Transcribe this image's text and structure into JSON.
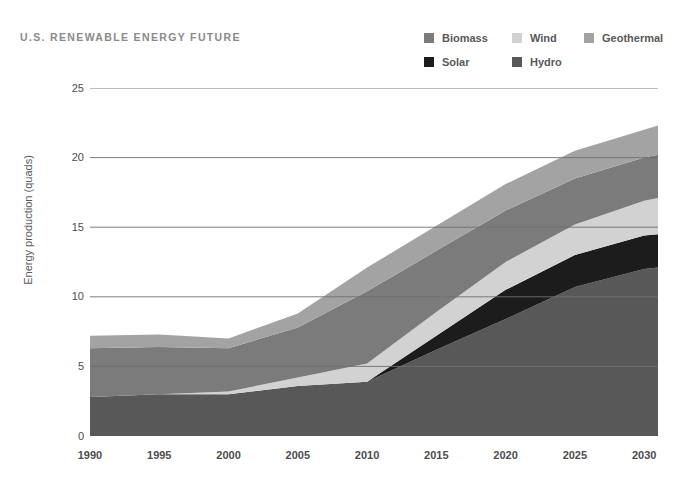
{
  "title": "U.S. RENEWABLE ENERGY FUTURE",
  "legend": {
    "rows": [
      [
        {
          "label": "Biomass",
          "color": "#7b7b7b",
          "x": 0
        },
        {
          "label": "Wind",
          "color": "#d2d2d2",
          "x": 88
        },
        {
          "label": "Geothermal",
          "color": "#a3a3a3",
          "x": 160
        }
      ],
      [
        {
          "label": "Solar",
          "color": "#1c1c1c",
          "x": 0
        },
        {
          "label": "Hydro",
          "color": "#585858",
          "x": 88
        }
      ]
    ]
  },
  "chart_data": {
    "type": "area",
    "stacked": true,
    "title": "U.S. RENEWABLE ENERGY FUTURE",
    "xlabel": "",
    "ylabel": "Energy production (quads)",
    "xlim": [
      1990,
      2031
    ],
    "ylim": [
      0,
      25
    ],
    "yticks": [
      0,
      5,
      10,
      15,
      20,
      25
    ],
    "xticks": [
      1990,
      1995,
      2000,
      2005,
      2010,
      2015,
      2020,
      2025,
      2030
    ],
    "grid": "horizontal",
    "legend_position": "top-right",
    "x": [
      1990,
      1995,
      2000,
      2005,
      2010,
      2015,
      2020,
      2025,
      2030,
      2031
    ],
    "series": [
      {
        "name": "Hydro",
        "color": "#585858",
        "values": [
          2.8,
          3.0,
          3.0,
          3.6,
          3.9,
          6.2,
          8.4,
          10.7,
          12.0,
          12.1
        ]
      },
      {
        "name": "Solar",
        "color": "#1c1c1c",
        "values": [
          0.0,
          0.0,
          0.0,
          0.0,
          0.0,
          1.0,
          2.1,
          2.3,
          2.4,
          2.4
        ]
      },
      {
        "name": "Wind",
        "color": "#d2d2d2",
        "values": [
          0.0,
          0.0,
          0.2,
          0.6,
          1.3,
          1.7,
          2.0,
          2.2,
          2.5,
          2.6
        ]
      },
      {
        "name": "Biomass",
        "color": "#7b7b7b",
        "values": [
          3.5,
          3.4,
          3.1,
          3.6,
          5.2,
          4.4,
          3.7,
          3.3,
          3.1,
          3.1
        ]
      },
      {
        "name": "Geothermal",
        "color": "#a3a3a3",
        "values": [
          0.9,
          0.9,
          0.7,
          1.0,
          1.7,
          1.8,
          1.9,
          2.0,
          2.0,
          2.1
        ]
      }
    ]
  },
  "colors": {
    "background": "#ffffff",
    "gridline": "#6f6f6f",
    "axis_text": "#4d4d4d",
    "title_text": "#8a8a8a",
    "legend_text": "#595959"
  }
}
